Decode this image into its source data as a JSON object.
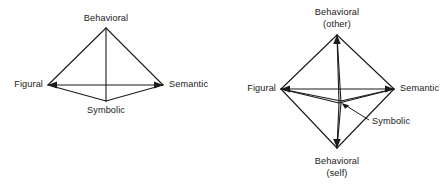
{
  "figure": {
    "background_color": "#ffffff",
    "line_color": "#1a1a1a",
    "text_color": "#1a1a1a",
    "diagrams": [
      {
        "name": "tetrahedron-model",
        "shape": "tetrahedron",
        "vertices": [
          {
            "key": "behavioral",
            "label": "Behavioral",
            "label_line2": "",
            "x": 106,
            "y": 28,
            "label_x": 106,
            "label_y": 13,
            "align": "center"
          },
          {
            "key": "figural",
            "label": "Figural",
            "label_line2": "",
            "x": 48,
            "y": 85,
            "label_x": 43,
            "label_y": 79,
            "align": "right"
          },
          {
            "key": "semantic",
            "label": "Semantic",
            "label_line2": "",
            "x": 163,
            "y": 85,
            "label_x": 169,
            "label_y": 79,
            "align": "left"
          },
          {
            "key": "symbolic",
            "label": "Symbolic",
            "label_line2": "",
            "x": 106,
            "y": 101,
            "label_x": 106,
            "label_y": 105,
            "align": "center"
          }
        ]
      },
      {
        "name": "octahedron-model",
        "shape": "octahedron",
        "vertices": [
          {
            "key": "behavioral-other",
            "label": "Behavioral",
            "label_line2": "(other)",
            "x": 337,
            "y": 35,
            "label_x": 337,
            "label_y": 7,
            "align": "center"
          },
          {
            "key": "figural",
            "label": "Figural",
            "label_line2": "",
            "x": 281,
            "y": 89,
            "label_x": 276,
            "label_y": 83,
            "align": "right"
          },
          {
            "key": "semantic",
            "label": "Semantic",
            "label_line2": "",
            "x": 394,
            "y": 89,
            "label_x": 400,
            "label_y": 83,
            "align": "left"
          },
          {
            "key": "behavioral-self",
            "label": "Behavioral",
            "label_line2": "(self)",
            "x": 337,
            "y": 148,
            "label_x": 337,
            "label_y": 156,
            "align": "center"
          },
          {
            "key": "symbolic",
            "label": "Symbolic",
            "label_line2": "",
            "x": 339,
            "y": 103,
            "label_x": 372,
            "label_y": 116,
            "align": "left"
          }
        ],
        "callout": {
          "name": "symbolic-callout",
          "label": "Symbolic",
          "from_x": 369,
          "from_y": 120,
          "to_x": 342,
          "to_y": 104
        }
      }
    ]
  }
}
